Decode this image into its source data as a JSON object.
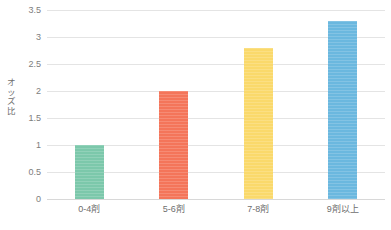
{
  "chart_data": {
    "type": "bar",
    "title": "",
    "subtitle": "",
    "xlabel": "",
    "ylabel": "オッズ比",
    "categories": [
      "0-4剤",
      "5-6剤",
      "7-8剤",
      "9剤以上"
    ],
    "values": [
      1,
      2,
      2.8,
      3.3
    ],
    "series": [
      {
        "name": "オッズ比",
        "values": [
          1,
          2,
          2.8,
          3.3
        ]
      }
    ],
    "bar_colors": [
      "#7cc8ab",
      "#f4755a",
      "#fad96b",
      "#6bb8df"
    ],
    "ylim": [
      0,
      3.5
    ],
    "ytick_labels": [
      "0",
      "0.5",
      "1",
      "1.5",
      "2",
      "2.5",
      "3",
      "3.5"
    ],
    "ytick_values": [
      0,
      0.5,
      1,
      1.5,
      2,
      2.5,
      3,
      3.5
    ],
    "grid": "horizontal",
    "legend": "none",
    "annotations": []
  },
  "axis": {
    "y_title_chars": "オ\nッ\nズ\n比"
  },
  "colors": {
    "gridline": "#e4e4e4",
    "baseline": "#d8d8d8",
    "tick_text": "#7d7d7d",
    "background": "#ffffff"
  }
}
